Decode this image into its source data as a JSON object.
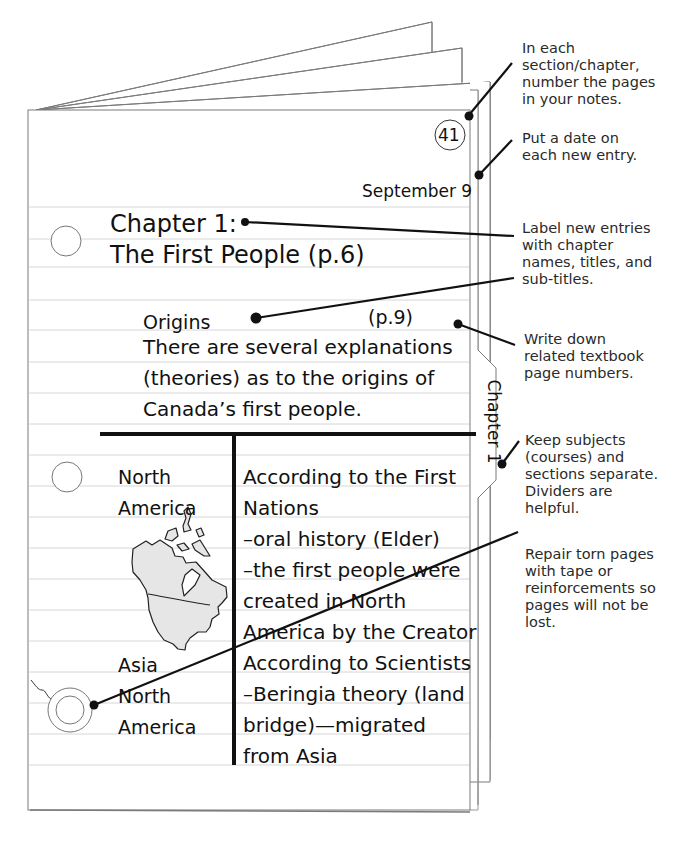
{
  "page": {
    "title_partial": ""
  },
  "notebook": {
    "page_number": "41",
    "date": "September 9",
    "chapter_heading_line1": "Chapter 1:",
    "chapter_heading_line2": "The First People (p.6)",
    "subtitle": "Origins",
    "subtitle_page_ref": "(p.9)",
    "intro_lines": [
      "There are several explanations",
      "(theories) as to the origins of",
      "Canada’s first people."
    ],
    "tab_label": "Chapter 1",
    "table": {
      "left_column": [
        "North",
        "America",
        "Asia",
        "North",
        "America"
      ],
      "right_column": [
        "According to the First",
        "Nations",
        "–oral history (Elder)",
        "–the first people were",
        "created in North",
        "America by the Creator",
        "According to Scientists",
        "–Beringia theory (land",
        "bridge)—migrated",
        "from Asia"
      ],
      "map_icon": "north-america-map"
    }
  },
  "annotations": [
    {
      "id": "number-pages",
      "text": "In each\nsection/chapter,\nnumber the pages\nin your notes."
    },
    {
      "id": "date-entry",
      "text": "Put a date on\neach new entry."
    },
    {
      "id": "label-entries",
      "text": "Label new entries\nwith chapter\nnames, titles, and\nsub-titles."
    },
    {
      "id": "page-numbers",
      "text": "Write down\nrelated textbook\npage numbers."
    },
    {
      "id": "keep-separate",
      "text": "Keep subjects\n(courses) and\nsections separate.\nDividers are\nhelpful."
    },
    {
      "id": "repair-pages",
      "text": "Repair torn pages\nwith tape or\nreinforcements so\npages will not be\nlost."
    }
  ],
  "colors": {
    "ink": "#111111",
    "rule_line": "#d6d6d6",
    "page_border": "#8a8a8a",
    "map_fill": "#e6e6e6",
    "annotation_text": "#2a2a2a"
  }
}
